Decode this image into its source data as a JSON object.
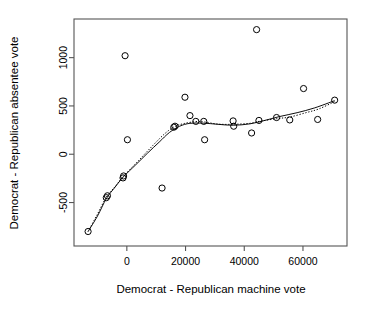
{
  "chart_data": {
    "type": "scatter",
    "title": "",
    "xlabel": "Democrat - Republican machine vote",
    "ylabel": "Democrat - Republican absentee vote",
    "xlim": [
      -18000,
      75000
    ],
    "ylim": [
      -950,
      1400
    ],
    "grid": false,
    "legend": null,
    "xticks": [
      0,
      20000,
      40000,
      60000
    ],
    "xtick_labels": [
      "0",
      "20000",
      "40000",
      "60000"
    ],
    "yticks": [
      -500,
      0,
      500,
      1000
    ],
    "ytick_labels": [
      "-500",
      "0",
      "500",
      "1000"
    ],
    "marker": "open-circle",
    "points": [
      {
        "x": -13200,
        "y": -800
      },
      {
        "x": -7000,
        "y": -450
      },
      {
        "x": -6600,
        "y": -430
      },
      {
        "x": -1300,
        "y": -245
      },
      {
        "x": -1100,
        "y": -225
      },
      {
        "x": -600,
        "y": 1020
      },
      {
        "x": 200,
        "y": 150
      },
      {
        "x": 12000,
        "y": -350
      },
      {
        "x": 16000,
        "y": 280
      },
      {
        "x": 16400,
        "y": 290
      },
      {
        "x": 19800,
        "y": 590
      },
      {
        "x": 21500,
        "y": 400
      },
      {
        "x": 23500,
        "y": 340
      },
      {
        "x": 26200,
        "y": 340
      },
      {
        "x": 26500,
        "y": 150
      },
      {
        "x": 36200,
        "y": 345
      },
      {
        "x": 36400,
        "y": 290
      },
      {
        "x": 44200,
        "y": 1290
      },
      {
        "x": 42500,
        "y": 220
      },
      {
        "x": 45000,
        "y": 350
      },
      {
        "x": 51000,
        "y": 380
      },
      {
        "x": 55500,
        "y": 355
      },
      {
        "x": 60200,
        "y": 680
      },
      {
        "x": 65000,
        "y": 360
      },
      {
        "x": 70800,
        "y": 560
      }
    ],
    "series": [
      {
        "name": "solid-fit-line",
        "style": "solid",
        "points": [
          {
            "x": -13200,
            "y": -800
          },
          {
            "x": -10000,
            "y": -640
          },
          {
            "x": -7000,
            "y": -460
          },
          {
            "x": -4000,
            "y": -340
          },
          {
            "x": -1200,
            "y": -235
          },
          {
            "x": 3000,
            "y": -110
          },
          {
            "x": 7000,
            "y": 10
          },
          {
            "x": 11000,
            "y": 125
          },
          {
            "x": 14500,
            "y": 225
          },
          {
            "x": 18000,
            "y": 290
          },
          {
            "x": 21500,
            "y": 320
          },
          {
            "x": 26000,
            "y": 322
          },
          {
            "x": 31000,
            "y": 310
          },
          {
            "x": 36300,
            "y": 300
          },
          {
            "x": 42000,
            "y": 315
          },
          {
            "x": 47000,
            "y": 350
          },
          {
            "x": 52000,
            "y": 390
          },
          {
            "x": 58000,
            "y": 430
          },
          {
            "x": 64000,
            "y": 480
          },
          {
            "x": 70800,
            "y": 555
          }
        ]
      },
      {
        "name": "dotted-fit-line",
        "style": "dotted",
        "points": [
          {
            "x": -13200,
            "y": -800
          },
          {
            "x": -10000,
            "y": -620
          },
          {
            "x": -7000,
            "y": -445
          },
          {
            "x": -4000,
            "y": -335
          },
          {
            "x": -1200,
            "y": -230
          },
          {
            "x": 4000,
            "y": -65
          },
          {
            "x": 9000,
            "y": 95
          },
          {
            "x": 13000,
            "y": 215
          },
          {
            "x": 16200,
            "y": 285
          },
          {
            "x": 19500,
            "y": 318
          },
          {
            "x": 23500,
            "y": 338
          },
          {
            "x": 26300,
            "y": 335
          },
          {
            "x": 31000,
            "y": 312
          },
          {
            "x": 36300,
            "y": 310
          },
          {
            "x": 42000,
            "y": 320
          },
          {
            "x": 45000,
            "y": 340
          },
          {
            "x": 51000,
            "y": 368
          },
          {
            "x": 55500,
            "y": 385
          },
          {
            "x": 61000,
            "y": 430
          },
          {
            "x": 65500,
            "y": 470
          },
          {
            "x": 70800,
            "y": 545
          }
        ]
      }
    ]
  }
}
